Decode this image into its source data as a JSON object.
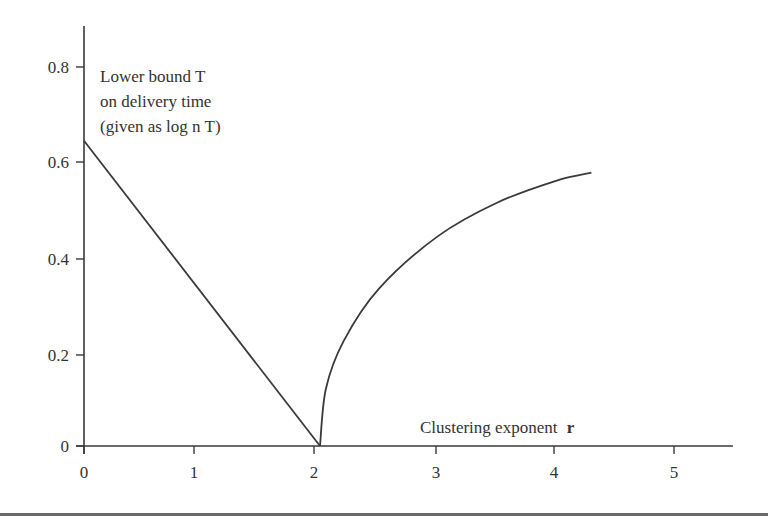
{
  "chart_data": {
    "type": "line",
    "title": "",
    "annotation": {
      "lines": [
        "Lower bound T",
        "on delivery time",
        "(given as log n T)"
      ]
    },
    "xlabel": "Clustering exponent",
    "xlabel_symbol": "r",
    "ylabel": "",
    "xlim": [
      0,
      5.5
    ],
    "ylim": [
      0,
      0.88
    ],
    "x_ticks": [
      "0",
      "1",
      "2",
      "3",
      "4",
      "5"
    ],
    "y_ticks": [
      "0",
      "0.2",
      "0.4",
      "0.6",
      "0.8"
    ],
    "grid": false,
    "legend": null,
    "series": [
      {
        "name": "lower bound (r < 2)",
        "x": [
          0,
          2
        ],
        "y": [
          0.64,
          0.0
        ]
      },
      {
        "name": "lower bound (r > 2)",
        "x": [
          2.0,
          2.05,
          2.2,
          2.5,
          3.0,
          3.5,
          4.0,
          4.3
        ],
        "y": [
          0.0,
          0.12,
          0.22,
          0.33,
          0.44,
          0.51,
          0.556,
          0.573
        ]
      }
    ]
  }
}
